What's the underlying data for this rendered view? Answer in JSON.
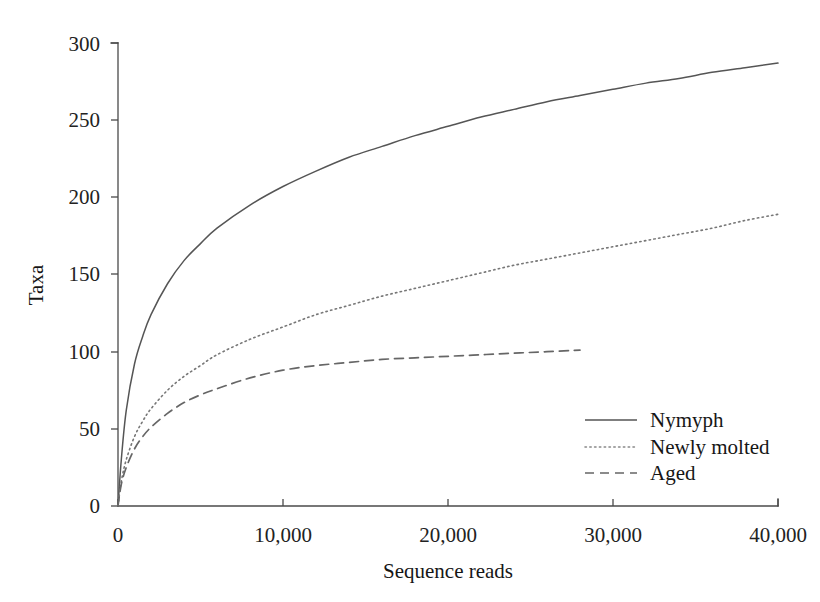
{
  "chart_data": {
    "type": "line",
    "title": "",
    "subtitle": "",
    "xlabel": "Sequence reads",
    "ylabel": "Taxa",
    "xlim": [
      0,
      40000
    ],
    "ylim": [
      0,
      300
    ],
    "grid": false,
    "legend_position": "bottom-right",
    "x_ticks": [
      0,
      10000,
      20000,
      30000,
      40000
    ],
    "x_tick_labels": [
      "0",
      "10,000",
      "20,000",
      "30,000",
      "40,000"
    ],
    "y_ticks": [
      0,
      50,
      100,
      150,
      200,
      250,
      300
    ],
    "y_tick_labels": [
      "0",
      "50",
      "100",
      "150",
      "200",
      "250",
      "300"
    ],
    "series": [
      {
        "name": "Nymyph",
        "style": "solid",
        "color": "#555555",
        "x": [
          0,
          200,
          500,
          1000,
          1500,
          2000,
          3000,
          4000,
          5000,
          6000,
          8000,
          10000,
          12000,
          14000,
          16000,
          18000,
          20000,
          22000,
          24000,
          26000,
          28000,
          30000,
          32000,
          34000,
          36000,
          38000,
          40000
        ],
        "y": [
          0,
          30,
          62,
          92,
          110,
          124,
          144,
          159,
          170,
          180,
          195,
          207,
          217,
          226,
          233,
          240,
          246,
          252,
          257,
          262,
          266,
          270,
          274,
          277,
          281,
          284,
          287
        ]
      },
      {
        "name": "Newly molted",
        "style": "dotted",
        "color": "#777777",
        "x": [
          0,
          200,
          500,
          1000,
          1500,
          2000,
          3000,
          4000,
          5000,
          6000,
          8000,
          10000,
          12000,
          14000,
          16000,
          18000,
          20000,
          22000,
          24000,
          26000,
          28000,
          30000,
          32000,
          34000,
          36000,
          38000,
          40000
        ],
        "y": [
          0,
          16,
          30,
          45,
          55,
          63,
          75,
          84,
          91,
          98,
          108,
          116,
          124,
          130,
          136,
          141,
          146,
          151,
          156,
          160,
          164,
          168,
          172,
          176,
          180,
          185,
          189
        ]
      },
      {
        "name": "Aged",
        "style": "dashed",
        "color": "#666666",
        "x": [
          0,
          200,
          500,
          1000,
          1500,
          2000,
          3000,
          4000,
          5000,
          6000,
          8000,
          10000,
          12000,
          14000,
          16000,
          18000,
          20000,
          22000,
          24000,
          26000,
          28000
        ],
        "y": [
          0,
          14,
          25,
          37,
          45,
          51,
          60,
          67,
          72,
          76,
          83,
          88,
          91,
          93,
          95,
          96,
          97,
          98,
          99,
          100,
          101
        ]
      }
    ]
  },
  "legend": {
    "items": [
      {
        "label": "Nymyph",
        "style": "solid"
      },
      {
        "label": "Newly molted",
        "style": "dotted"
      },
      {
        "label": "Aged",
        "style": "dashed"
      }
    ]
  }
}
